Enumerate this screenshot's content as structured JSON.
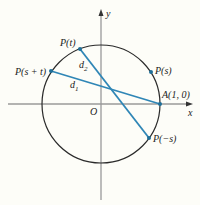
{
  "diagram": {
    "colors": {
      "background": "#fdfdf8",
      "axis": "#9a9a9a",
      "circle": "#2a2a2a",
      "chord": "#2f86b6",
      "point": "#1f6f99",
      "text": "#222222"
    },
    "axes": {
      "x_label": "x",
      "y_label": "y",
      "origin_label": "O"
    },
    "points": [
      {
        "id": "P_t",
        "label": "P(t)"
      },
      {
        "id": "P_s_plus_t",
        "label": "P(s + t)"
      },
      {
        "id": "P_s",
        "label": "P(s)"
      },
      {
        "id": "A",
        "label": "A(1, 0)"
      },
      {
        "id": "P_minus_s",
        "label": "P(−s)"
      }
    ],
    "segments": [
      {
        "id": "d1",
        "label": "d",
        "subscript": "1",
        "from": "P(s + t)",
        "to": "A(1, 0)"
      },
      {
        "id": "d2",
        "label": "d",
        "subscript": "2",
        "from": "P(t)",
        "to": "P(−s)"
      }
    ]
  }
}
